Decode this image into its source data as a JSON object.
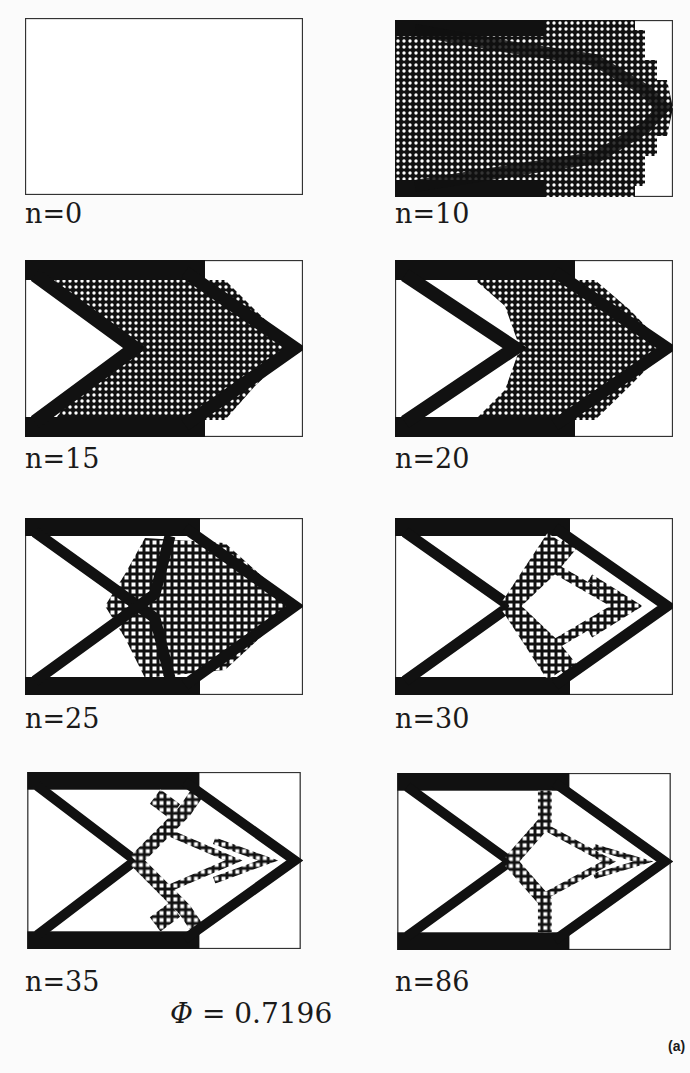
{
  "figure": {
    "panels": [
      {
        "iteration_label": "n=0",
        "stage": "empty"
      },
      {
        "iteration_label": "n=10",
        "stage": "dense"
      },
      {
        "iteration_label": "n=15",
        "stage": "chevron-dense"
      },
      {
        "iteration_label": "n=20",
        "stage": "chevron-cross"
      },
      {
        "iteration_label": "n=25",
        "stage": "cross-dense"
      },
      {
        "iteration_label": "n=30",
        "stage": "truss-forming"
      },
      {
        "iteration_label": "n=35",
        "stage": "truss"
      },
      {
        "iteration_label": "n=86",
        "stage": "truss-final"
      }
    ],
    "objective": {
      "symbol": "Φ",
      "equals": "=",
      "value": "0.7196"
    },
    "subfigure_tag": "(a)"
  },
  "colors": {
    "ink": "#111111",
    "frame": "#333333",
    "paper": "#fbfbfb"
  }
}
